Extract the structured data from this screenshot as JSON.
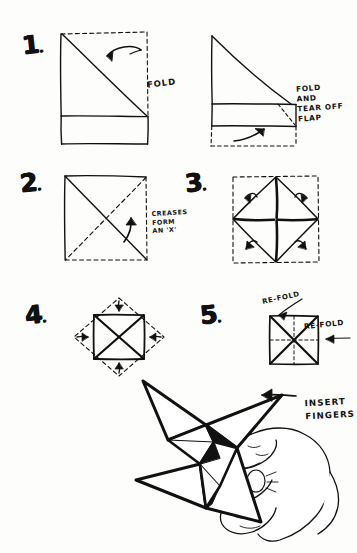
{
  "document": {
    "title": "Paper Fortune Teller / Ninja Star Folding Instructions",
    "medium": "hand-drawn pen sketch on white paper",
    "ink_color": "#111111",
    "paper_color": "#fdfdfc"
  },
  "steps": [
    {
      "id": "step-1",
      "number": "1",
      "number_suffix": ".",
      "figures": [
        {
          "name": "square-with-diagonal-fold",
          "description": "square sheet, solid left and bottom edges, dashed top and right edges, diagonal crease from top-left to bottom-right, horizontal line near bottom",
          "annotation": "FOLD"
        },
        {
          "name": "folded-triangle-with-flap",
          "description": "triangle folded over, solid band, dashed flap at bottom with curved arrow",
          "annotation": "FOLD\nAND\nTEAR OFF\nFLAP"
        }
      ]
    },
    {
      "id": "step-2",
      "number": "2",
      "number_suffix": ".",
      "figures": [
        {
          "name": "square-with-x-creases",
          "description": "square with both diagonals, one solid one dashed, forming an X; curved arrow inside",
          "annotation": "CREASES\nFORM\nAN 'X'"
        }
      ]
    },
    {
      "id": "step-3",
      "number": "3",
      "number_suffix": ".",
      "figures": [
        {
          "name": "diamond-with-cross-and-corner-arrows",
          "description": "dashed square outline with inscribed diamond, bold cross through centre, four curved arrows at the corners pointing inward",
          "annotation": ""
        }
      ]
    },
    {
      "id": "step-4",
      "number": "4",
      "number_suffix": ".",
      "figures": [
        {
          "name": "square-inside-dashed-diamond",
          "description": "solid square with bold X inside, surrounded by dashed diamond; four arrows pointing inward from each diamond side",
          "annotation": ""
        }
      ]
    },
    {
      "id": "step-5",
      "number": "5",
      "number_suffix": ".",
      "figures": [
        {
          "name": "square-with-x-and-dashed-cross",
          "description": "solid square with bold X diagonals plus dashed horizontal and vertical centre lines",
          "annotations": [
            "RE-FOLD",
            "RE-FOLD"
          ]
        }
      ]
    }
  ],
  "labels": {
    "fold": "FOLD",
    "fold_and_tear_off_flap": "FOLD\nAND\nTEAR OFF\nFLAP",
    "creases_form_an_x": "CREASES\nFORM\nAN 'X'",
    "re_fold_top": "RE-FOLD",
    "re_fold_right": "RE-FOLD",
    "insert_fingers": "INSERT\nFINGERS"
  },
  "final_illustration": {
    "name": "finished-star-in-hand",
    "description": "completed four-pointed paper star held by a hand, with an arrow pointing to where fingers are inserted",
    "annotation": "INSERT\nFINGERS"
  }
}
